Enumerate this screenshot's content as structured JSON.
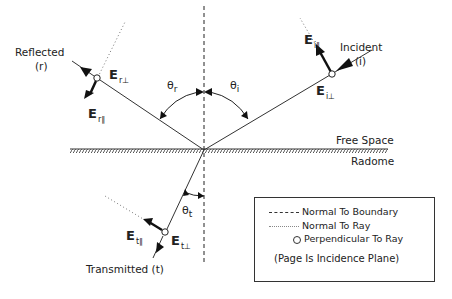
{
  "diagram": {
    "regions": {
      "upper": "Free Space",
      "lower": "Radome"
    },
    "rays": {
      "incident": {
        "label": "Incident",
        "symbol": "(i)",
        "e_parallel": "E",
        "e_parallel_sub": "i∥",
        "e_perp": "E",
        "e_perp_sub": "i⊥"
      },
      "reflected": {
        "label": "Reflected",
        "symbol": "(r)",
        "e_parallel": "E",
        "e_parallel_sub": "r∥",
        "e_perp": "E",
        "e_perp_sub": "r⊥"
      },
      "transmitted": {
        "label": "Transmitted (t)",
        "e_parallel": "E",
        "e_parallel_sub": "t∥",
        "e_perp": "E",
        "e_perp_sub": "t⊥"
      }
    },
    "angles": {
      "reflected": {
        "symbol": "θ",
        "sub": "r"
      },
      "incident": {
        "symbol": "θ",
        "sub": "i"
      },
      "transmitted": {
        "symbol": "θ",
        "sub": "t"
      }
    },
    "legend": {
      "items": [
        {
          "style": "dashed",
          "label": "Normal To Boundary"
        },
        {
          "style": "dotted",
          "label": "Normal To Ray"
        },
        {
          "style": "circle",
          "label": "Perpendicular To Ray"
        }
      ],
      "note": "(Page Is Incidence Plane)"
    }
  }
}
